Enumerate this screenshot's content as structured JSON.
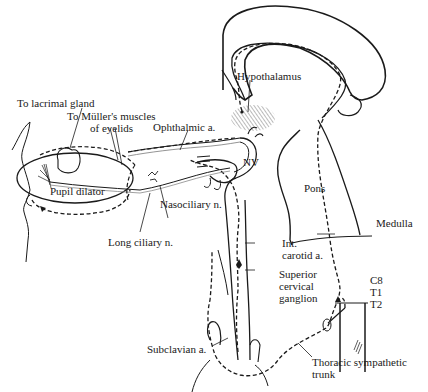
{
  "figure": {
    "labels": {
      "hypothalamus": "Hypothalamus",
      "lacrimal": "To lacrimal gland",
      "muller_1": "To Müller's muscles",
      "muller_2": "of eyelids",
      "ophthalmic": "Ophthalmic a.",
      "nv": "NV",
      "pons": "Pons",
      "pupil": "Pupil dilator",
      "nasociliary": "Nasociliary n.",
      "long_ciliary": "Long ciliary n.",
      "medulla": "Medulla",
      "int_carotid_1": "Int.",
      "int_carotid_2": "carotid a.",
      "scg_1": "Superior",
      "scg_2": "cervical",
      "scg_3": "ganglion",
      "c8": "C8",
      "t1": "T1",
      "t2": "T2",
      "subclavian": "Subclavian a.",
      "thoracic_1": "Thoracic sympathetic",
      "thoracic_2": "trunk"
    },
    "colors": {
      "ink": "#1a1a1a",
      "hatch": "#555555",
      "background": "#ffffff"
    }
  }
}
